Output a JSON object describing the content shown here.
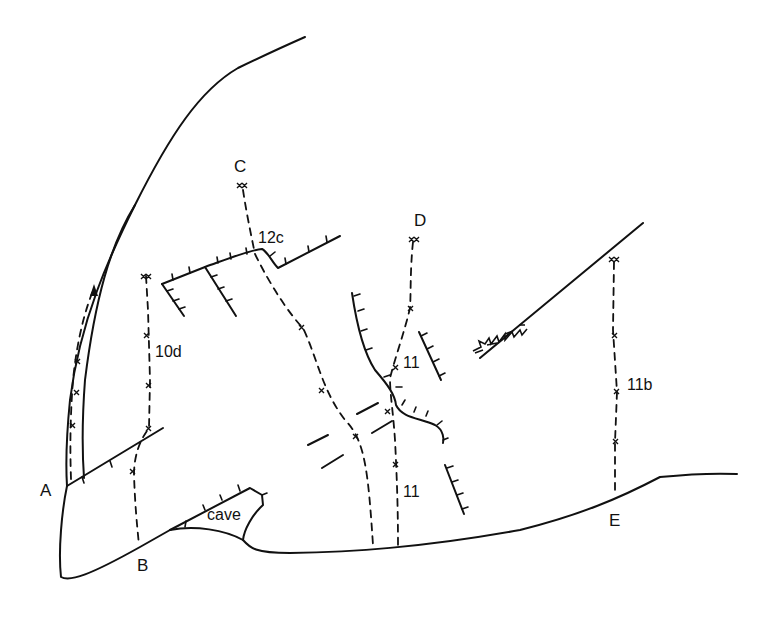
{
  "diagram": {
    "type": "climbing-topo",
    "start_labels": {
      "A": "A",
      "B": "B",
      "C": "C",
      "D": "D",
      "E": "E"
    },
    "routes": [
      {
        "id": "A",
        "grade": ""
      },
      {
        "id": "B",
        "grade": "10d"
      },
      {
        "id": "C",
        "grade": "12c"
      },
      {
        "id": "D",
        "grade": "11"
      },
      {
        "id": "D-lower",
        "grade": "11"
      },
      {
        "id": "E",
        "grade": "11b"
      }
    ],
    "features": {
      "cave": "cave"
    }
  }
}
